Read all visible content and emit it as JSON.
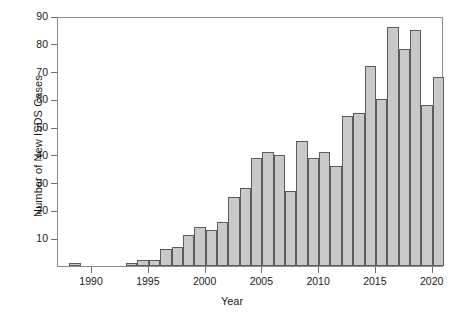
{
  "chart_data": {
    "type": "bar",
    "title": "",
    "xlabel": "Year",
    "ylabel": "Number of New ISDS Cases",
    "grid": false,
    "legend": null,
    "xlim": [
      1987,
      2021
    ],
    "ylim": [
      0,
      90
    ],
    "ytick_labels": [
      "10",
      "20",
      "30",
      "40",
      "50",
      "60",
      "70",
      "80",
      "90"
    ],
    "ytick_values": [
      10,
      20,
      30,
      40,
      50,
      60,
      70,
      80,
      90
    ],
    "xtick_labels": [
      "1990",
      "1995",
      "2000",
      "2005",
      "2010",
      "2015",
      "2020"
    ],
    "xtick_values": [
      1990,
      1995,
      2000,
      2005,
      2010,
      2015,
      2020
    ],
    "bar_fill_color": "#c9c9c9",
    "bar_edge_color": "#5c5c5c",
    "axis_color": "#8c8c8c",
    "categories": [
      1988,
      1989,
      1990,
      1991,
      1992,
      1993,
      1994,
      1995,
      1996,
      1997,
      1998,
      1999,
      2000,
      2001,
      2002,
      2003,
      2004,
      2005,
      2006,
      2007,
      2008,
      2009,
      2010,
      2011,
      2012,
      2013,
      2014,
      2015,
      2016,
      2017,
      2018,
      2019,
      2020
    ],
    "values": [
      1,
      0,
      0,
      0,
      0,
      1,
      2,
      2,
      6,
      7,
      11,
      14,
      13,
      16,
      25,
      28,
      39,
      41,
      40,
      27,
      45,
      39,
      41,
      36,
      54,
      55,
      72,
      60,
      86,
      78,
      85,
      58,
      68
    ]
  }
}
